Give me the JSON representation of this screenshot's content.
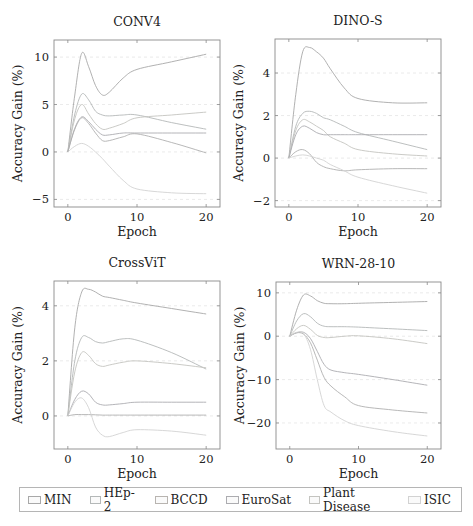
{
  "legend": [
    {
      "label": "MIN",
      "color": "#a8a8a8"
    },
    {
      "label": "HEp-2",
      "color": "#b4b8b8"
    },
    {
      "label": "BCCD",
      "color": "#b8b4b0"
    },
    {
      "label": "EuroSat",
      "color": "#acacb0"
    },
    {
      "label": "Plant Disease",
      "color": "#c4c4c0"
    },
    {
      "label": "ISIC",
      "color": "#d2d2d2"
    }
  ],
  "chart_data": [
    {
      "type": "line",
      "title": "CONV4",
      "xlabel": "Epoch",
      "ylabel": "Accuracy Gain (%)",
      "xticks": [
        0,
        10,
        20
      ],
      "yticks": [
        -5,
        0,
        5,
        10
      ],
      "xlim": [
        -2,
        22
      ],
      "ylim": [
        -5.8,
        11.8
      ],
      "grid": "dashed horizontal",
      "frame": {
        "left": 54,
        "right": 220,
        "top": 40,
        "bottom": 207
      },
      "x": [
        0,
        1,
        2,
        3,
        4,
        5,
        6,
        8,
        10,
        15,
        20
      ],
      "series": [
        {
          "name": "s1",
          "values": [
            0,
            6,
            10.4,
            9,
            7,
            6,
            6.3,
            7.8,
            8.7,
            9.5,
            10.3
          ]
        },
        {
          "name": "s2",
          "values": [
            0,
            4,
            6.1,
            5.5,
            4.3,
            3.9,
            3.8,
            3.9,
            3.9,
            3.1,
            2.4
          ]
        },
        {
          "name": "s3",
          "values": [
            0,
            3.5,
            5.0,
            4.0,
            3.0,
            2.4,
            2.5,
            3.0,
            3.6,
            3.9,
            4.2
          ]
        },
        {
          "name": "s4",
          "values": [
            0,
            2.5,
            3.7,
            3.2,
            2.4,
            1.8,
            1.8,
            2.0,
            2.0,
            2.0,
            2.0
          ]
        },
        {
          "name": "s5",
          "values": [
            0,
            2.4,
            3.6,
            3.0,
            2.0,
            1.2,
            1.2,
            1.6,
            1.9,
            1.0,
            -0.1
          ]
        },
        {
          "name": "s6",
          "values": [
            0,
            0.6,
            0.9,
            0.6,
            0,
            -0.7,
            -1.5,
            -3.0,
            -3.9,
            -4.3,
            -4.4
          ]
        }
      ]
    },
    {
      "type": "line",
      "title": "DINO-S",
      "xlabel": "Epoch",
      "ylabel": "Accuracy Gain (%)",
      "xticks": [
        0,
        10,
        20
      ],
      "yticks": [
        -2,
        0,
        2,
        4
      ],
      "xlim": [
        -2,
        22
      ],
      "ylim": [
        -2.3,
        5.6
      ],
      "grid": "dashed horizontal",
      "frame": {
        "left": 275,
        "right": 441,
        "top": 39,
        "bottom": 207
      },
      "x": [
        0,
        1,
        2,
        3,
        4,
        5,
        6,
        8,
        10,
        15,
        20
      ],
      "series": [
        {
          "name": "s1",
          "values": [
            0,
            3.0,
            5.0,
            5.2,
            5.0,
            4.7,
            4.2,
            3.3,
            2.8,
            2.6,
            2.6
          ]
        },
        {
          "name": "s2",
          "values": [
            0,
            1.5,
            2.1,
            2.2,
            2.1,
            1.9,
            1.8,
            1.5,
            1.2,
            0.8,
            0.4
          ]
        },
        {
          "name": "s3",
          "values": [
            0,
            1.3,
            1.8,
            1.7,
            1.5,
            1.3,
            1.0,
            0.7,
            0.4,
            0.2,
            0.1
          ]
        },
        {
          "name": "s4",
          "values": [
            0,
            1.1,
            1.5,
            1.4,
            1.2,
            1.1,
            1.1,
            1.1,
            1.1,
            1.1,
            1.1
          ]
        },
        {
          "name": "s5",
          "values": [
            0,
            0.3,
            0.4,
            0.2,
            -0.2,
            -0.4,
            -0.5,
            -0.6,
            -0.55,
            -0.5,
            -0.5
          ]
        },
        {
          "name": "s6",
          "values": [
            0,
            0.1,
            0.15,
            0.1,
            0,
            -0.1,
            -0.3,
            -0.6,
            -0.9,
            -1.3,
            -1.65
          ]
        }
      ]
    },
    {
      "type": "line",
      "title": "CrossViT",
      "xlabel": "Epoch",
      "ylabel": "Accuracy Gain (%)",
      "xticks": [
        0,
        10,
        20
      ],
      "yticks": [
        0,
        2,
        4
      ],
      "xlim": [
        -2,
        22
      ],
      "ylim": [
        -1.2,
        4.9
      ],
      "grid": "dashed horizontal",
      "frame": {
        "left": 54,
        "right": 220,
        "top": 281,
        "bottom": 449
      },
      "x": [
        0,
        1,
        2,
        3,
        4,
        5,
        6,
        8,
        10,
        15,
        20
      ],
      "series": [
        {
          "name": "s1",
          "values": [
            0,
            3.2,
            4.5,
            4.6,
            4.5,
            4.35,
            4.3,
            4.2,
            4.1,
            3.9,
            3.7
          ]
        },
        {
          "name": "s2",
          "values": [
            0,
            2.0,
            2.85,
            2.85,
            2.7,
            2.65,
            2.7,
            2.8,
            2.75,
            2.3,
            1.7
          ]
        },
        {
          "name": "s3",
          "values": [
            0,
            1.6,
            2.3,
            2.2,
            1.9,
            1.8,
            1.85,
            1.95,
            2.0,
            1.9,
            1.75
          ]
        },
        {
          "name": "s4",
          "values": [
            0,
            0.6,
            0.9,
            0.8,
            0.5,
            0.4,
            0.4,
            0.45,
            0.5,
            0.5,
            0.5
          ]
        },
        {
          "name": "s5",
          "values": [
            0,
            0.05,
            0.05,
            0.05,
            0.04,
            0.03,
            0.03,
            0.03,
            0.03,
            0.03,
            0.03
          ]
        },
        {
          "name": "s6",
          "values": [
            0,
            0.5,
            0.65,
            0.3,
            -0.4,
            -0.7,
            -0.75,
            -0.6,
            -0.5,
            -0.55,
            -0.7
          ]
        }
      ]
    },
    {
      "type": "line",
      "title": "WRN-28-10",
      "xlabel": "Epoch",
      "ylabel": "Accuracy Gain (%)",
      "xticks": [
        0,
        10,
        20
      ],
      "yticks": [
        -20,
        -10,
        0,
        10
      ],
      "xlim": [
        -2,
        22
      ],
      "ylim": [
        -26,
        12.5
      ],
      "grid": "dashed horizontal",
      "frame": {
        "left": 276,
        "right": 441,
        "top": 282,
        "bottom": 449
      },
      "x": [
        0,
        1,
        2,
        3,
        4,
        5,
        6,
        8,
        10,
        15,
        20
      ],
      "series": [
        {
          "name": "s1",
          "values": [
            0,
            6,
            9.5,
            9.3,
            8.2,
            7.6,
            7.5,
            7.5,
            7.6,
            7.8,
            8.0
          ]
        },
        {
          "name": "s2",
          "values": [
            0,
            3.5,
            5.2,
            4.5,
            3.0,
            2.3,
            2.2,
            2.2,
            2.1,
            1.7,
            1.3
          ]
        },
        {
          "name": "s3",
          "values": [
            0,
            1.7,
            2.5,
            1.6,
            0.2,
            -0.3,
            -0.3,
            0,
            0.1,
            -0.6,
            -1.7
          ]
        },
        {
          "name": "s4",
          "values": [
            0,
            0.8,
            0.9,
            -0.5,
            -3.5,
            -6.5,
            -7.8,
            -8.4,
            -8.8,
            -10,
            -11.3
          ]
        },
        {
          "name": "s5",
          "values": [
            0,
            0.8,
            0.5,
            -1.5,
            -5.5,
            -9.5,
            -11.5,
            -14,
            -16,
            -17,
            -17.7
          ]
        },
        {
          "name": "s6",
          "values": [
            0,
            0.9,
            0.6,
            -3,
            -10,
            -16,
            -17.5,
            -19.5,
            -20.6,
            -22,
            -23
          ]
        }
      ]
    }
  ],
  "line_colors": [
    "#a8a8a8",
    "#b4b8b8",
    "#c4c4c0",
    "#acacb0",
    "#b0b0b0",
    "#d2d2d2"
  ]
}
